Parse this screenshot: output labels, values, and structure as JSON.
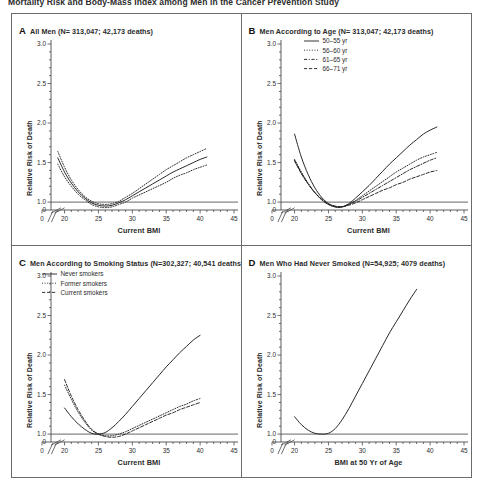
{
  "figure": {
    "top_title": "Mortality Risk and Body-Mass Index among Men in the Cancer Prevention Study",
    "y_axis_label": "Relative Risk of Death"
  },
  "panels": [
    {
      "letter": "A",
      "title": "All Men (N= 313,047; 42,173 deaths)",
      "xlabel": "Current BMI",
      "ylabel": "Relative Risk of Death"
    },
    {
      "letter": "B",
      "title": "Men According to Age (N= 313,047; 42,173 deaths)",
      "xlabel": "Current BMI",
      "ylabel": "Relative Risk of Death",
      "legend": [
        {
          "label": "50–55 yr",
          "style": "solid"
        },
        {
          "label": "56–60 yr",
          "style": "dotted"
        },
        {
          "label": "61–65 yr",
          "style": "dashdot"
        },
        {
          "label": "66–71 yr",
          "style": "dashed"
        }
      ]
    },
    {
      "letter": "C",
      "title": "Men According to Smoking Status (N=302,327; 40,541 deaths)",
      "xlabel": "Current BMI",
      "ylabel": "Relative Risk of Death",
      "legend": [
        {
          "label": "Never smokers",
          "style": "solid"
        },
        {
          "label": "Former smokers",
          "style": "dotted"
        },
        {
          "label": "Current smokers",
          "style": "dashed"
        }
      ]
    },
    {
      "letter": "D",
      "title": "Men Who Had Never Smoked (N=54,925; 4079  deaths)",
      "xlabel": "BMI at 50 Yr of Age",
      "ylabel": "Relative Risk of Death"
    }
  ],
  "chart_data": [
    {
      "id": "panel-a",
      "type": "line",
      "title": "All Men (N= 313,047; 42,173 deaths)",
      "xlabel": "Current BMI",
      "ylabel": "Relative Risk of Death",
      "xlim": [
        18,
        45
      ],
      "ylim": [
        0.9,
        3.0
      ],
      "ytick_values": [
        1.0,
        1.5,
        2.0,
        2.5,
        3.0
      ],
      "ytick_labels": [
        "1.0",
        "1.5",
        "2.0",
        "2.5",
        "3.0"
      ],
      "xtick_values": [
        20,
        25,
        30,
        35,
        40,
        45
      ],
      "xtick_labels": [
        "20",
        "25",
        "30",
        "35",
        "40",
        "45"
      ],
      "axis_break": true,
      "zero_label": "0",
      "reference_line_y": 1.0,
      "grid": false,
      "legend_position": "none",
      "series": [
        {
          "name": "All men (point estimate)",
          "style": "solid",
          "x": [
            19.0,
            20.0,
            21.0,
            22.0,
            23.0,
            24.0,
            25.0,
            26.0,
            27.0,
            28.0,
            29.0,
            30.0,
            31.0,
            32.0,
            33.0,
            34.0,
            35.0,
            36.0,
            37.0,
            38.0,
            39.0,
            40.0,
            41.0
          ],
          "y": [
            1.56,
            1.38,
            1.24,
            1.13,
            1.05,
            0.99,
            0.96,
            0.95,
            0.96,
            0.99,
            1.03,
            1.08,
            1.13,
            1.18,
            1.23,
            1.28,
            1.33,
            1.38,
            1.42,
            1.46,
            1.5,
            1.54,
            1.57
          ]
        },
        {
          "name": "Upper 95% confidence limit",
          "style": "dotted",
          "x": [
            19.0,
            20.0,
            21.0,
            22.0,
            23.0,
            24.0,
            25.0,
            26.0,
            27.0,
            28.0,
            29.0,
            30.0,
            31.0,
            32.0,
            33.0,
            34.0,
            35.0,
            36.0,
            37.0,
            38.0,
            39.0,
            40.0,
            41.0
          ],
          "y": [
            1.64,
            1.44,
            1.28,
            1.16,
            1.07,
            1.01,
            0.98,
            0.97,
            0.98,
            1.01,
            1.06,
            1.11,
            1.17,
            1.23,
            1.29,
            1.35,
            1.41,
            1.46,
            1.51,
            1.56,
            1.6,
            1.64,
            1.68
          ]
        },
        {
          "name": "Lower 95% confidence limit",
          "style": "dotted",
          "x": [
            19.0,
            20.0,
            21.0,
            22.0,
            23.0,
            24.0,
            25.0,
            26.0,
            27.0,
            28.0,
            29.0,
            30.0,
            31.0,
            32.0,
            33.0,
            34.0,
            35.0,
            36.0,
            37.0,
            38.0,
            39.0,
            40.0,
            41.0
          ],
          "y": [
            1.48,
            1.32,
            1.2,
            1.1,
            1.03,
            0.97,
            0.94,
            0.93,
            0.94,
            0.97,
            1.0,
            1.05,
            1.09,
            1.13,
            1.17,
            1.21,
            1.25,
            1.3,
            1.34,
            1.37,
            1.41,
            1.44,
            1.47
          ]
        }
      ]
    },
    {
      "id": "panel-b",
      "type": "line",
      "title": "Men According to Age (N= 313,047; 42,173 deaths)",
      "xlabel": "Current BMI",
      "ylabel": "Relative Risk of Death",
      "xlim": [
        18,
        45
      ],
      "ylim": [
        0.9,
        3.0
      ],
      "ytick_values": [
        1.0,
        1.5,
        2.0,
        2.5,
        3.0
      ],
      "ytick_labels": [
        "1.0",
        "1.5",
        "2.0",
        "2.5",
        "3.0"
      ],
      "xtick_values": [
        20,
        25,
        30,
        35,
        40,
        45
      ],
      "xtick_labels": [
        "20",
        "25",
        "30",
        "35",
        "40",
        "45"
      ],
      "axis_break": true,
      "zero_label": "0",
      "reference_line_y": 1.0,
      "grid": false,
      "legend_position": "top-left-inside",
      "series": [
        {
          "name": "50–55 yr",
          "style": "solid",
          "x": [
            20.0,
            21.0,
            22.0,
            23.0,
            24.0,
            25.0,
            26.0,
            27.0,
            28.0,
            29.0,
            30.0,
            31.0,
            32.0,
            33.0,
            34.0,
            35.0,
            36.0,
            37.0,
            38.0,
            39.0,
            40.0,
            41.0
          ],
          "y": [
            1.86,
            1.57,
            1.35,
            1.18,
            1.06,
            0.98,
            0.94,
            0.94,
            0.98,
            1.05,
            1.13,
            1.21,
            1.3,
            1.39,
            1.48,
            1.56,
            1.64,
            1.72,
            1.79,
            1.86,
            1.91,
            1.95
          ]
        },
        {
          "name": "56–60 yr",
          "style": "dotted",
          "x": [
            20.0,
            21.0,
            22.0,
            23.0,
            24.0,
            25.0,
            26.0,
            27.0,
            28.0,
            29.0,
            30.0,
            31.0,
            32.0,
            33.0,
            34.0,
            35.0,
            36.0,
            37.0,
            38.0,
            39.0,
            40.0,
            41.0
          ],
          "y": [
            1.54,
            1.38,
            1.24,
            1.12,
            1.03,
            0.97,
            0.94,
            0.94,
            0.97,
            1.02,
            1.08,
            1.14,
            1.2,
            1.26,
            1.32,
            1.38,
            1.43,
            1.48,
            1.53,
            1.57,
            1.6,
            1.63
          ]
        },
        {
          "name": "61–65 yr",
          "style": "dashdot",
          "x": [
            20.0,
            21.0,
            22.0,
            23.0,
            24.0,
            25.0,
            26.0,
            27.0,
            28.0,
            29.0,
            30.0,
            31.0,
            32.0,
            33.0,
            34.0,
            35.0,
            36.0,
            37.0,
            38.0,
            39.0,
            40.0,
            41.0
          ],
          "y": [
            1.53,
            1.37,
            1.23,
            1.12,
            1.03,
            0.97,
            0.94,
            0.94,
            0.97,
            1.01,
            1.06,
            1.11,
            1.16,
            1.21,
            1.26,
            1.31,
            1.36,
            1.41,
            1.45,
            1.49,
            1.53,
            1.56
          ]
        },
        {
          "name": "66–71 yr",
          "style": "dashed",
          "x": [
            20.0,
            21.0,
            22.0,
            23.0,
            24.0,
            25.0,
            26.0,
            27.0,
            28.0,
            29.0,
            30.0,
            31.0,
            32.0,
            33.0,
            34.0,
            35.0,
            36.0,
            37.0,
            38.0,
            39.0,
            40.0,
            41.0
          ],
          "y": [
            1.52,
            1.36,
            1.23,
            1.12,
            1.04,
            0.98,
            0.95,
            0.94,
            0.96,
            0.99,
            1.03,
            1.07,
            1.11,
            1.15,
            1.18,
            1.22,
            1.25,
            1.29,
            1.32,
            1.35,
            1.38,
            1.4
          ]
        }
      ]
    },
    {
      "id": "panel-c",
      "type": "line",
      "title": "Men According to Smoking Status (N=302,327; 40,541 deaths)",
      "xlabel": "Current BMI",
      "ylabel": "Relative Risk of Death",
      "xlim": [
        18,
        45
      ],
      "ylim": [
        0.9,
        3.0
      ],
      "ytick_values": [
        1.0,
        1.5,
        2.0,
        2.5,
        3.0
      ],
      "ytick_labels": [
        "1.0",
        "1.5",
        "2.0",
        "2.5",
        "3.0"
      ],
      "xtick_values": [
        20,
        25,
        30,
        35,
        40,
        45
      ],
      "xtick_labels": [
        "20",
        "25",
        "30",
        "35",
        "40",
        "45"
      ],
      "axis_break": true,
      "zero_label": "0",
      "reference_line_y": 1.0,
      "grid": false,
      "legend_position": "top-left-inside",
      "series": [
        {
          "name": "Never smokers",
          "style": "solid",
          "x": [
            20.0,
            21.0,
            22.0,
            23.0,
            24.0,
            25.0,
            26.0,
            27.0,
            28.0,
            29.0,
            30.0,
            31.0,
            32.0,
            33.0,
            34.0,
            35.0,
            36.0,
            37.0,
            38.0,
            39.0,
            40.0
          ],
          "y": [
            1.33,
            1.22,
            1.13,
            1.06,
            1.01,
            1.0,
            1.02,
            1.08,
            1.16,
            1.25,
            1.35,
            1.45,
            1.55,
            1.65,
            1.75,
            1.85,
            1.94,
            2.03,
            2.11,
            2.19,
            2.25
          ]
        },
        {
          "name": "Former smokers",
          "style": "dotted",
          "x": [
            20.0,
            21.0,
            22.0,
            23.0,
            24.0,
            25.0,
            26.0,
            27.0,
            28.0,
            29.0,
            30.0,
            31.0,
            32.0,
            33.0,
            34.0,
            35.0,
            36.0,
            37.0,
            38.0,
            39.0,
            40.0
          ],
          "y": [
            1.62,
            1.44,
            1.28,
            1.15,
            1.05,
            1.0,
            0.98,
            0.98,
            1.0,
            1.03,
            1.07,
            1.11,
            1.15,
            1.19,
            1.23,
            1.27,
            1.31,
            1.35,
            1.38,
            1.42,
            1.45
          ]
        },
        {
          "name": "Current smokers",
          "style": "dashed",
          "x": [
            20.0,
            21.0,
            22.0,
            23.0,
            24.0,
            25.0,
            26.0,
            27.0,
            28.0,
            29.0,
            30.0,
            31.0,
            32.0,
            33.0,
            34.0,
            35.0,
            36.0,
            37.0,
            38.0,
            39.0,
            40.0
          ],
          "y": [
            1.69,
            1.48,
            1.31,
            1.17,
            1.06,
            1.0,
            0.97,
            0.96,
            0.97,
            1.0,
            1.04,
            1.08,
            1.12,
            1.16,
            1.2,
            1.24,
            1.27,
            1.31,
            1.34,
            1.37,
            1.4
          ]
        }
      ]
    },
    {
      "id": "panel-d",
      "type": "line",
      "title": "Men Who Had Never Smoked (N=54,925; 4079  deaths)",
      "xlabel": "BMI at 50 Yr of Age",
      "ylabel": "Relative Risk of Death",
      "xlim": [
        18,
        45
      ],
      "ylim": [
        0.9,
        3.0
      ],
      "ytick_values": [
        1.0,
        1.5,
        2.0,
        2.5,
        3.0
      ],
      "ytick_labels": [
        "1.0",
        "1.5",
        "2.0",
        "2.5",
        "3.0"
      ],
      "xtick_values": [
        20,
        25,
        30,
        35,
        40,
        45
      ],
      "xtick_labels": [
        "20",
        "25",
        "30",
        "35",
        "40",
        "45"
      ],
      "axis_break": true,
      "zero_label": "0",
      "reference_line_y": 1.0,
      "grid": false,
      "legend_position": "none",
      "series": [
        {
          "name": "Men who had never smoked",
          "style": "solid",
          "x": [
            20.0,
            21.0,
            22.0,
            23.0,
            24.0,
            25.0,
            26.0,
            27.0,
            28.0,
            29.0,
            30.0,
            31.0,
            32.0,
            33.0,
            34.0,
            35.0,
            36.0,
            37.0,
            38.0
          ],
          "y": [
            1.22,
            1.12,
            1.05,
            1.01,
            1.0,
            1.01,
            1.07,
            1.18,
            1.32,
            1.48,
            1.64,
            1.8,
            1.96,
            2.12,
            2.28,
            2.42,
            2.56,
            2.7,
            2.83
          ]
        }
      ]
    }
  ]
}
